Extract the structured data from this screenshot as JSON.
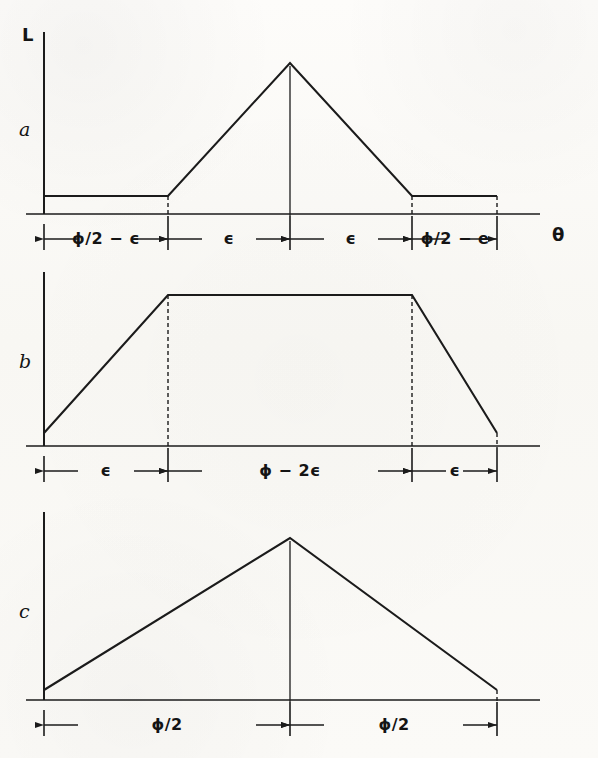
{
  "figure": {
    "background_color": "#fbfaf7",
    "ink_color": "#1b1b1b",
    "y_axis_label": "L",
    "x_axis_label": "θ"
  },
  "panels": [
    {
      "letter": "a",
      "shape": "pedestal-with-triangular-peak",
      "dimensions": [
        {
          "label": "ϕ/2 − ϵ"
        },
        {
          "label": "ϵ"
        },
        {
          "label": "ϵ"
        },
        {
          "label": "ϕ/2 − e"
        }
      ]
    },
    {
      "letter": "b",
      "shape": "trapezoid",
      "dimensions": [
        {
          "label": "ϵ"
        },
        {
          "label": "ϕ − 2ϵ"
        },
        {
          "label": "ϵ"
        }
      ]
    },
    {
      "letter": "c",
      "shape": "triangle",
      "dimensions": [
        {
          "label": "ϕ/2"
        },
        {
          "label": "ϕ/2"
        }
      ]
    }
  ],
  "chart_data": {
    "type": "line",
    "title": "",
    "xlabel": "θ",
    "ylabel": "L",
    "grid": false,
    "legend": null,
    "shared_x_axis": {
      "x_origin_px": 44,
      "x_end_px": 540
    },
    "panels": [
      {
        "name": "a",
        "shape": "pedestal with triangular peak",
        "x": [
          44,
          168,
          290,
          412,
          497
        ],
        "y": [
          0.13,
          0.13,
          1.0,
          0.13,
          0.13
        ],
        "ylim": [
          0,
          1.08
        ],
        "vertices_px": [
          {
            "x": 44,
            "y": 196
          },
          {
            "x": 168,
            "y": 196
          },
          {
            "x": 290,
            "y": 63
          },
          {
            "x": 412,
            "y": 196
          },
          {
            "x": 497,
            "y": 196
          }
        ],
        "baseline_px": 214,
        "droplines_px": [
          168,
          290,
          412,
          497
        ],
        "segments": [
          {
            "label": "ϕ/2 − ϵ",
            "from_px": 44,
            "to_px": 168
          },
          {
            "label": "ϵ",
            "from_px": 168,
            "to_px": 290
          },
          {
            "label": "ϵ",
            "from_px": 290,
            "to_px": 412
          },
          {
            "label": "ϕ/2 − e",
            "from_px": 412,
            "to_px": 497
          }
        ]
      },
      {
        "name": "b",
        "shape": "trapezoid",
        "x": [
          44,
          168,
          412,
          497
        ],
        "y": [
          0.16,
          1.0,
          1.0,
          0.16
        ],
        "ylim": [
          0,
          1.08
        ],
        "vertices_px": [
          {
            "x": 44,
            "y": 433
          },
          {
            "x": 168,
            "y": 295
          },
          {
            "x": 412,
            "y": 295
          },
          {
            "x": 497,
            "y": 433
          }
        ],
        "baseline_px": 446,
        "droplines_px": [
          168,
          412,
          497
        ],
        "segments": [
          {
            "label": "ϵ",
            "from_px": 44,
            "to_px": 168
          },
          {
            "label": "ϕ − 2ϵ",
            "from_px": 168,
            "to_px": 412
          },
          {
            "label": "ϵ",
            "from_px": 412,
            "to_px": 497
          }
        ]
      },
      {
        "name": "c",
        "shape": "triangle",
        "x": [
          44,
          290,
          497
        ],
        "y": [
          0.12,
          1.0,
          0.12
        ],
        "ylim": [
          0,
          1.08
        ],
        "vertices_px": [
          {
            "x": 44,
            "y": 690
          },
          {
            "x": 290,
            "y": 538
          },
          {
            "x": 497,
            "y": 690
          }
        ],
        "baseline_px": 700,
        "droplines_px": [
          290,
          497
        ],
        "segments": [
          {
            "label": "ϕ/2",
            "from_px": 44,
            "to_px": 290
          },
          {
            "label": "ϕ/2",
            "from_px": 290,
            "to_px": 497
          }
        ]
      }
    ]
  }
}
